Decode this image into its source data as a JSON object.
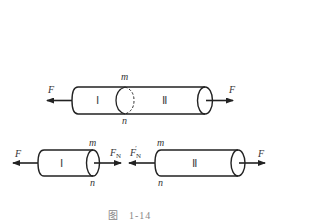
{
  "figure": {
    "caption_prefix": "图",
    "caption_number": "1-14"
  },
  "top_bar": {
    "left_force": "F",
    "right_force": "F",
    "section_top": "m",
    "section_bottom": "n",
    "part_left": "Ⅰ",
    "part_right": "Ⅱ"
  },
  "bottom_left_bar": {
    "left_force": "F",
    "right_force": "F",
    "right_force_sub": "N",
    "section_top": "m",
    "section_bottom": "n",
    "part": "Ⅰ"
  },
  "bottom_right_bar": {
    "left_force": "F",
    "left_force_sub": "N",
    "left_force_prime": "′",
    "right_force": "F",
    "section_top": "m",
    "section_bottom": "n",
    "part": "Ⅱ"
  },
  "colors": {
    "line": "#222222",
    "caption": "#888888"
  }
}
